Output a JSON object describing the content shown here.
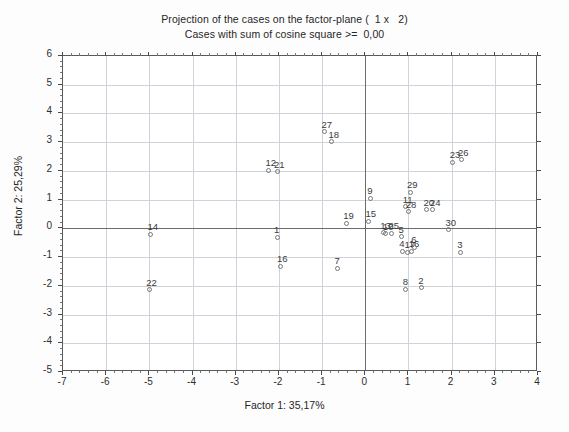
{
  "chart_data": {
    "type": "scatter",
    "title": "Projection of the cases on the factor-plane (  1 x   2)",
    "subtitle": "Cases with sum of cosine square >=  0,00",
    "xlabel": "Factor 1: 35,17%",
    "ylabel": "Factor 2: 25,29%",
    "xlim": [
      -7,
      4
    ],
    "ylim": [
      -5,
      6
    ],
    "xticks": [
      -7,
      -6,
      -5,
      -4,
      -3,
      -2,
      -1,
      0,
      1,
      2,
      3,
      4
    ],
    "xtick_labels": [
      "-7",
      "-6",
      "-5",
      "-4",
      "-3",
      "-2",
      "-1",
      "0",
      "1",
      "2",
      "3",
      "4"
    ],
    "yticks": [
      6,
      5,
      4,
      3,
      2,
      1,
      0,
      -1,
      -2,
      -3,
      -4,
      -5
    ],
    "ytick_labels": [
      "6",
      "5",
      "4",
      "3",
      "2",
      "1",
      "0",
      "-1",
      "-2",
      "-3",
      "-4",
      "-5"
    ],
    "grid": true,
    "legend": null,
    "zero_lines": {
      "x": 0,
      "y": 0
    },
    "points": [
      {
        "label": "27",
        "x": -0.92,
        "y": 3.32
      },
      {
        "label": "18",
        "x": -0.76,
        "y": 2.98
      },
      {
        "label": "12",
        "x": -2.22,
        "y": 1.98
      },
      {
        "label": "21",
        "x": -2.02,
        "y": 1.94
      },
      {
        "label": "23",
        "x": 2.05,
        "y": 2.26
      },
      {
        "label": "26",
        "x": 2.24,
        "y": 2.36
      },
      {
        "label": "9",
        "x": 0.14,
        "y": 1.02
      },
      {
        "label": "29",
        "x": 1.06,
        "y": 1.22
      },
      {
        "label": "11",
        "x": 0.96,
        "y": 0.72
      },
      {
        "label": "28",
        "x": 1.03,
        "y": 0.54
      },
      {
        "label": "20",
        "x": 1.44,
        "y": 0.62
      },
      {
        "label": "24",
        "x": 1.59,
        "y": 0.62
      },
      {
        "label": "19",
        "x": -0.42,
        "y": 0.14
      },
      {
        "label": "15",
        "x": 0.1,
        "y": 0.22
      },
      {
        "label": "13",
        "x": 0.44,
        "y": -0.18
      },
      {
        "label": "10",
        "x": 0.5,
        "y": -0.22
      },
      {
        "label": "25",
        "x": 0.63,
        "y": -0.2
      },
      {
        "label": "5",
        "x": 0.86,
        "y": -0.32
      },
      {
        "label": "30",
        "x": 1.95,
        "y": -0.08
      },
      {
        "label": "14",
        "x": -4.95,
        "y": -0.24
      },
      {
        "label": "1",
        "x": -2.02,
        "y": -0.34
      },
      {
        "label": "4",
        "x": 0.88,
        "y": -0.84
      },
      {
        "label": "17",
        "x": 1.0,
        "y": -0.86
      },
      {
        "label": "16",
        "x": 1.1,
        "y": -0.84
      },
      {
        "label": "6",
        "x": 1.16,
        "y": -0.7
      },
      {
        "label": "3",
        "x": 2.22,
        "y": -0.86
      },
      {
        "label": "16b",
        "x": -1.95,
        "y": -1.36
      },
      {
        "label": "7",
        "x": -0.62,
        "y": -1.42
      },
      {
        "label": "8",
        "x": 0.96,
        "y": -2.16
      },
      {
        "label": "2",
        "x": 1.32,
        "y": -2.1
      },
      {
        "label": "22",
        "x": -4.98,
        "y": -2.18
      }
    ],
    "point_label_overrides": {
      "16b": "16"
    }
  },
  "style": {
    "grid_color": "#cfd3da",
    "axis_color": "#6c6c6c",
    "frame_color": "#5a5a5a",
    "text_color": "#262626",
    "marker_color": "#777777",
    "background": "#ffffff"
  }
}
